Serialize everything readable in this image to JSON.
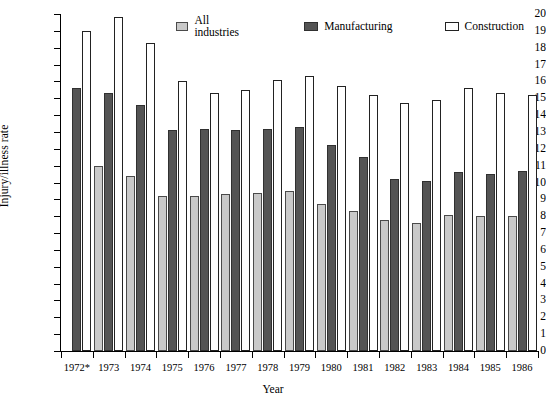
{
  "chart_data": {
    "type": "bar",
    "title": "",
    "xlabel": "Year",
    "ylabel": "Injury/illness rate",
    "ylim": [
      0,
      20
    ],
    "ytick_step": 1,
    "grid": false,
    "legend_position": "top-center",
    "categories": [
      "1972*",
      "1973",
      "1974",
      "1975",
      "1976",
      "1977",
      "1978",
      "1979",
      "1980",
      "1981",
      "1982",
      "1983",
      "1984",
      "1985",
      "1986"
    ],
    "yticks": [
      "0",
      "1",
      "2",
      "3",
      "4",
      "5",
      "6",
      "7",
      "8",
      "9",
      "10",
      "11",
      "12",
      "13",
      "14",
      "15",
      "16",
      "17",
      "18",
      "19",
      "20"
    ],
    "series": [
      {
        "name": "All industries",
        "color": "#c9c9c9",
        "values": [
          null,
          11.0,
          10.4,
          9.2,
          9.2,
          9.3,
          9.4,
          9.5,
          8.7,
          8.3,
          7.8,
          7.6,
          8.1,
          8.0,
          8.0
        ]
      },
      {
        "name": "Manufacturing",
        "color": "#545454",
        "values": [
          15.6,
          15.3,
          14.6,
          13.1,
          13.2,
          13.1,
          13.2,
          13.3,
          12.2,
          11.5,
          10.2,
          10.1,
          10.6,
          10.5,
          10.7
        ]
      },
      {
        "name": "Construction",
        "color": "#ffffff",
        "values": [
          19.0,
          19.8,
          18.3,
          16.0,
          15.3,
          15.5,
          16.1,
          16.3,
          15.7,
          15.2,
          14.7,
          14.9,
          15.6,
          15.3,
          15.2
        ]
      }
    ]
  },
  "legend": {
    "items": [
      {
        "label": "All industries"
      },
      {
        "label": "Manufacturing"
      },
      {
        "label": "Construction"
      }
    ]
  },
  "axes": {
    "y_title": "Injury/illness rate",
    "x_title": "Year"
  }
}
